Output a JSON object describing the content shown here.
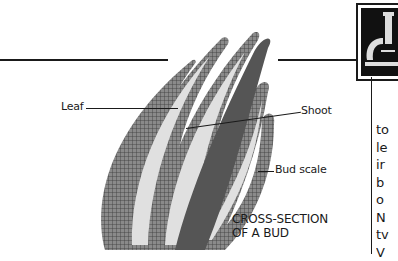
{
  "figure": {
    "title_line1": "CROSS-SECTION",
    "title_line2": "OF A BUD",
    "labels": {
      "leaf": "Leaf",
      "shoot": "Shoot",
      "bud_scale": "Bud scale"
    }
  },
  "icon": {
    "name": "microscope-icon"
  },
  "side_column": {
    "lines": [
      "to",
      "le",
      "ir",
      "b",
      "o",
      "N",
      "tv",
      "V"
    ]
  },
  "colors": {
    "ink": "#1a1a1a",
    "paper": "#ffffff",
    "tissue": "#6b6b6b",
    "gap": "#d8d8d8"
  }
}
